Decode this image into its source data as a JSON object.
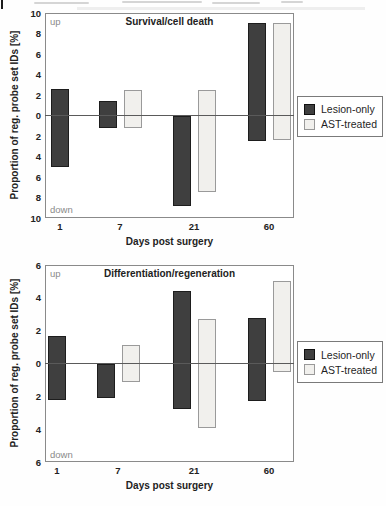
{
  "figure": {
    "colors": {
      "lesion_only": "#3f3f3f",
      "ast_treated": "#f1f0ed",
      "axis_border": "#8a8a8a",
      "updown_text": "#8a8a8a"
    }
  },
  "chart_data": [
    {
      "type": "bar",
      "variant": "diverging-range-bars",
      "title": "Survival/cell death",
      "xlabel": "Days post surgery",
      "ylabel": "Proportion of reg. probe set IDs [%]",
      "up_label": "up",
      "down_label": "down",
      "ylim": [
        -10,
        10
      ],
      "grid": false,
      "legend_position": "right-outside",
      "ytick_labels": [
        "10",
        "8",
        "6",
        "4",
        "2",
        "0",
        "2",
        "4",
        "6",
        "8",
        "10"
      ],
      "categories": [
        "1",
        "7",
        "21",
        "60"
      ],
      "series": [
        {
          "name": "Lesion-only",
          "color": "#3f3f3f",
          "up_pct": [
            2.6,
            1.4,
            0.0,
            9.0
          ],
          "down_pct": [
            5.0,
            1.2,
            8.8,
            2.5
          ]
        },
        {
          "name": "AST-treated",
          "color": "#f1f0ed",
          "up_pct": [
            null,
            2.5,
            2.5,
            9.0
          ],
          "down_pct": [
            null,
            1.2,
            7.5,
            2.4
          ]
        }
      ]
    },
    {
      "type": "bar",
      "variant": "diverging-range-bars",
      "title": "Differentiation/regeneration",
      "xlabel": "Days post surgery",
      "ylabel": "Proportion of reg. probe set IDs [%]",
      "up_label": "up",
      "down_label": "down",
      "ylim": [
        -6,
        6
      ],
      "grid": false,
      "legend_position": "right-outside",
      "ytick_labels": [
        "6",
        "4",
        "2",
        "0",
        "2",
        "4",
        "6"
      ],
      "categories": [
        "1",
        "7",
        "21",
        "60"
      ],
      "series": [
        {
          "name": "Lesion-only",
          "color": "#3f3f3f",
          "up_pct": [
            1.7,
            0.0,
            4.4,
            2.8
          ],
          "down_pct": [
            2.2,
            2.1,
            2.8,
            2.3
          ]
        },
        {
          "name": "AST-treated",
          "color": "#f1f0ed",
          "up_pct": [
            null,
            1.1,
            2.7,
            5.0
          ],
          "down_pct": [
            null,
            1.1,
            3.9,
            0.5
          ]
        }
      ]
    }
  ]
}
